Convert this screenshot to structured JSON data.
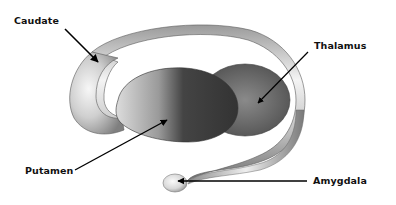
{
  "diagram": {
    "labels": [
      {
        "id": "caudate",
        "text": "Caudate"
      },
      {
        "id": "thalamus",
        "text": "Thalamus"
      },
      {
        "id": "putamen",
        "text": "Putamen"
      },
      {
        "id": "amygdala",
        "text": "Amygdala"
      }
    ],
    "colors": {
      "background": "#ffffff",
      "text": "#111111",
      "arrow": "#000000",
      "caudate_light": "#f2f2f2",
      "caudate_dark": "#7a7a7a",
      "putamen_dark": "#3f3f3f",
      "thalamus_mid": "#6a6a6a"
    }
  }
}
